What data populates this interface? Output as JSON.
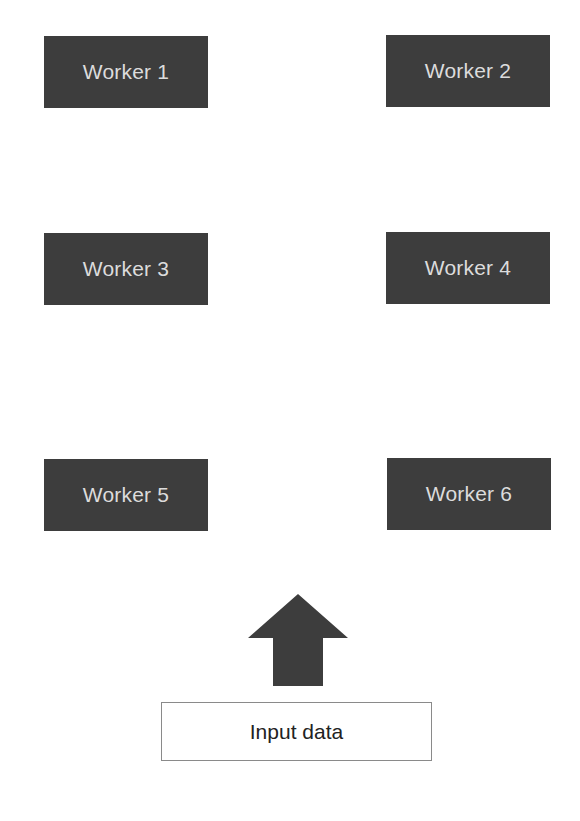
{
  "diagram": {
    "workers": [
      {
        "id": 1,
        "label": "Worker 1"
      },
      {
        "id": 2,
        "label": "Worker 2"
      },
      {
        "id": 3,
        "label": "Worker 3"
      },
      {
        "id": 4,
        "label": "Worker 4"
      },
      {
        "id": 5,
        "label": "Worker 5"
      },
      {
        "id": 6,
        "label": "Worker 6"
      }
    ],
    "input": {
      "label": "Input data"
    },
    "arrow": {
      "direction": "up",
      "icon": "up-arrow-icon"
    },
    "colors": {
      "worker_fill": "#3d3d3d",
      "worker_text": "#dcdcdc",
      "arrow_fill": "#3d3d3d",
      "input_border": "#8a8a8a",
      "input_text": "#222222",
      "background": "#ffffff"
    }
  }
}
